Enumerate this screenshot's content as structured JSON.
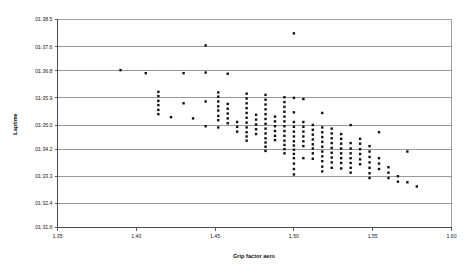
{
  "chart_data": {
    "type": "scatter",
    "title": "",
    "xlabel": "Grip factor aero",
    "ylabel": "Laptime",
    "xlim": [
      1.35,
      1.6
    ],
    "ylim": [
      91.6,
      98.5
    ],
    "grid": true,
    "legend": false,
    "marker": "square",
    "marker_color": "#101010",
    "x_ticks": [
      1.35,
      1.4,
      1.45,
      1.5,
      1.55,
      1.6
    ],
    "x_tick_labels": [
      "1.35",
      "1.40",
      "1.45",
      "1.50",
      "1.55",
      "1.60"
    ],
    "y_ticks": [
      91.6,
      92.4,
      93.3,
      94.2,
      95.0,
      95.9,
      96.8,
      97.6,
      98.5
    ],
    "y_tick_labels": [
      "01:31.6",
      "01:32.4",
      "01:33.3",
      "01:34.2",
      "01:35.0",
      "01:35.9",
      "01:36.8",
      "01:37.6",
      "01:38.5"
    ],
    "points": [
      [
        1.39,
        96.82
      ],
      [
        1.406,
        96.72
      ],
      [
        1.414,
        96.1
      ],
      [
        1.414,
        95.96
      ],
      [
        1.414,
        95.8
      ],
      [
        1.414,
        95.66
      ],
      [
        1.414,
        95.5
      ],
      [
        1.414,
        95.36
      ],
      [
        1.422,
        95.26
      ],
      [
        1.43,
        96.72
      ],
      [
        1.43,
        95.72
      ],
      [
        1.436,
        95.22
      ],
      [
        1.444,
        97.64
      ],
      [
        1.444,
        96.74
      ],
      [
        1.444,
        95.78
      ],
      [
        1.444,
        94.96
      ],
      [
        1.452,
        96.08
      ],
      [
        1.452,
        95.94
      ],
      [
        1.452,
        95.78
      ],
      [
        1.452,
        95.62
      ],
      [
        1.452,
        95.48
      ],
      [
        1.452,
        95.3
      ],
      [
        1.452,
        95.16
      ],
      [
        1.452,
        94.92
      ],
      [
        1.458,
        96.7
      ],
      [
        1.458,
        95.7
      ],
      [
        1.458,
        95.54
      ],
      [
        1.458,
        95.38
      ],
      [
        1.458,
        95.22
      ],
      [
        1.458,
        95.06
      ],
      [
        1.464,
        95.1
      ],
      [
        1.464,
        94.94
      ],
      [
        1.464,
        94.78
      ],
      [
        1.47,
        96.04
      ],
      [
        1.47,
        95.88
      ],
      [
        1.47,
        95.72
      ],
      [
        1.47,
        95.56
      ],
      [
        1.47,
        95.4
      ],
      [
        1.47,
        95.24
      ],
      [
        1.47,
        95.08
      ],
      [
        1.47,
        94.92
      ],
      [
        1.47,
        94.76
      ],
      [
        1.47,
        94.62
      ],
      [
        1.47,
        94.48
      ],
      [
        1.476,
        95.34
      ],
      [
        1.476,
        95.18
      ],
      [
        1.476,
        95.02
      ],
      [
        1.476,
        94.86
      ],
      [
        1.476,
        94.7
      ],
      [
        1.482,
        96.0
      ],
      [
        1.482,
        95.84
      ],
      [
        1.482,
        95.68
      ],
      [
        1.482,
        95.52
      ],
      [
        1.482,
        95.36
      ],
      [
        1.482,
        95.2
      ],
      [
        1.482,
        95.04
      ],
      [
        1.482,
        94.88
      ],
      [
        1.482,
        94.72
      ],
      [
        1.482,
        94.56
      ],
      [
        1.482,
        94.42
      ],
      [
        1.482,
        94.28
      ],
      [
        1.482,
        94.14
      ],
      [
        1.488,
        95.28
      ],
      [
        1.488,
        95.12
      ],
      [
        1.488,
        94.96
      ],
      [
        1.488,
        94.8
      ],
      [
        1.488,
        94.64
      ],
      [
        1.488,
        94.5
      ],
      [
        1.494,
        95.92
      ],
      [
        1.494,
        95.76
      ],
      [
        1.494,
        95.6
      ],
      [
        1.494,
        95.44
      ],
      [
        1.494,
        95.28
      ],
      [
        1.494,
        95.12
      ],
      [
        1.494,
        94.96
      ],
      [
        1.494,
        94.8
      ],
      [
        1.494,
        94.64
      ],
      [
        1.494,
        94.48
      ],
      [
        1.494,
        94.34
      ],
      [
        1.494,
        94.2
      ],
      [
        1.494,
        94.06
      ],
      [
        1.5,
        98.04
      ],
      [
        1.5,
        95.9
      ],
      [
        1.5,
        95.42
      ],
      [
        1.5,
        95.1
      ],
      [
        1.5,
        94.94
      ],
      [
        1.5,
        94.78
      ],
      [
        1.5,
        94.62
      ],
      [
        1.5,
        94.46
      ],
      [
        1.5,
        94.32
      ],
      [
        1.5,
        94.18
      ],
      [
        1.5,
        94.04
      ],
      [
        1.5,
        93.9
      ],
      [
        1.5,
        93.72
      ],
      [
        1.5,
        93.54
      ],
      [
        1.5,
        93.36
      ],
      [
        1.506,
        95.86
      ],
      [
        1.506,
        95.1
      ],
      [
        1.506,
        94.94
      ],
      [
        1.506,
        94.78
      ],
      [
        1.506,
        94.62
      ],
      [
        1.506,
        94.46
      ],
      [
        1.506,
        94.3
      ],
      [
        1.506,
        93.9
      ],
      [
        1.512,
        95.0
      ],
      [
        1.512,
        94.84
      ],
      [
        1.512,
        94.68
      ],
      [
        1.512,
        94.52
      ],
      [
        1.512,
        94.36
      ],
      [
        1.512,
        94.22
      ],
      [
        1.512,
        94.06
      ],
      [
        1.512,
        93.88
      ],
      [
        1.518,
        95.4
      ],
      [
        1.518,
        94.92
      ],
      [
        1.518,
        94.76
      ],
      [
        1.518,
        94.6
      ],
      [
        1.518,
        94.44
      ],
      [
        1.518,
        94.28
      ],
      [
        1.518,
        94.12
      ],
      [
        1.518,
        93.96
      ],
      [
        1.518,
        93.8
      ],
      [
        1.518,
        93.62
      ],
      [
        1.518,
        93.46
      ],
      [
        1.524,
        94.88
      ],
      [
        1.524,
        94.72
      ],
      [
        1.524,
        94.56
      ],
      [
        1.524,
        94.4
      ],
      [
        1.524,
        94.24
      ],
      [
        1.524,
        94.08
      ],
      [
        1.524,
        93.92
      ],
      [
        1.524,
        93.76
      ],
      [
        1.524,
        93.58
      ],
      [
        1.53,
        94.7
      ],
      [
        1.53,
        94.54
      ],
      [
        1.53,
        94.38
      ],
      [
        1.53,
        94.22
      ],
      [
        1.53,
        94.06
      ],
      [
        1.53,
        93.9
      ],
      [
        1.53,
        93.74
      ],
      [
        1.53,
        93.56
      ],
      [
        1.536,
        95.0
      ],
      [
        1.536,
        94.4
      ],
      [
        1.536,
        94.22
      ],
      [
        1.536,
        94.06
      ],
      [
        1.536,
        93.9
      ],
      [
        1.536,
        93.74
      ],
      [
        1.536,
        93.58
      ],
      [
        1.536,
        93.42
      ],
      [
        1.542,
        94.54
      ],
      [
        1.542,
        94.38
      ],
      [
        1.542,
        94.2
      ],
      [
        1.542,
        94.04
      ],
      [
        1.542,
        93.86
      ],
      [
        1.542,
        93.7
      ],
      [
        1.548,
        94.3
      ],
      [
        1.548,
        94.12
      ],
      [
        1.548,
        93.94
      ],
      [
        1.548,
        93.76
      ],
      [
        1.548,
        93.58
      ],
      [
        1.548,
        93.4
      ],
      [
        1.548,
        93.24
      ],
      [
        1.554,
        94.76
      ],
      [
        1.554,
        93.9
      ],
      [
        1.554,
        93.72
      ],
      [
        1.554,
        93.54
      ],
      [
        1.56,
        93.6
      ],
      [
        1.56,
        93.42
      ],
      [
        1.56,
        93.24
      ],
      [
        1.566,
        93.3
      ],
      [
        1.566,
        93.12
      ],
      [
        1.572,
        94.12
      ],
      [
        1.572,
        93.1
      ],
      [
        1.578,
        92.96
      ]
    ]
  }
}
